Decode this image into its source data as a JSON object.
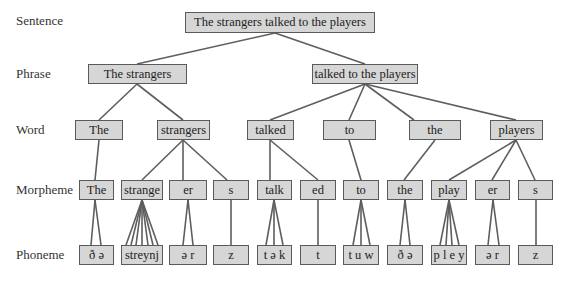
{
  "levels": {
    "sentence": "Sentence",
    "phrase": "Phrase",
    "word": "Word",
    "morpheme": "Morpheme",
    "phoneme": "Phoneme"
  },
  "sentence": {
    "text": "The strangers talked to the players"
  },
  "phrases": [
    {
      "text": "The strangers"
    },
    {
      "text": "talked to the players"
    }
  ],
  "words": [
    {
      "text": "The"
    },
    {
      "text": "strangers"
    },
    {
      "text": "talked"
    },
    {
      "text": "to"
    },
    {
      "text": "the"
    },
    {
      "text": "players"
    }
  ],
  "morphemes": [
    {
      "text": "The"
    },
    {
      "text": "strange"
    },
    {
      "text": "er"
    },
    {
      "text": "s"
    },
    {
      "text": "talk"
    },
    {
      "text": "ed"
    },
    {
      "text": "to"
    },
    {
      "text": "the"
    },
    {
      "text": "play"
    },
    {
      "text": "er"
    },
    {
      "text": "s"
    }
  ],
  "phonemes": [
    {
      "text": "ð ə",
      "count": 2
    },
    {
      "text": "streynj",
      "count": 7
    },
    {
      "text": "ə r",
      "count": 2
    },
    {
      "text": "z",
      "count": 1
    },
    {
      "text": "t ə k",
      "count": 3
    },
    {
      "text": "t",
      "count": 1
    },
    {
      "text": "t u w",
      "count": 3
    },
    {
      "text": "ð ə",
      "count": 2
    },
    {
      "text": "p l e y",
      "count": 4
    },
    {
      "text": "ə r",
      "count": 2
    },
    {
      "text": "z",
      "count": 1
    }
  ],
  "colors": {
    "box_fill": "#d6d6d6",
    "box_border": "#5a5a5a",
    "line": "#5a5a5a"
  }
}
